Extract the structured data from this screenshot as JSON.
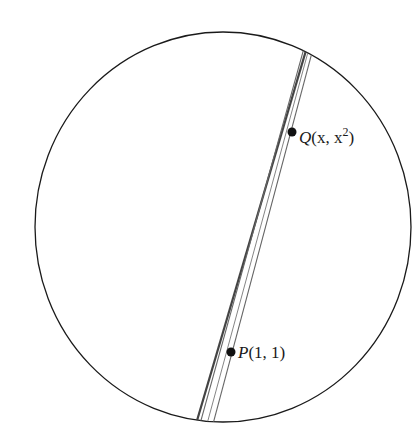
{
  "diagram": {
    "point_p": {
      "label": "P",
      "coords": "(1, 1)"
    },
    "point_q": {
      "label": "Q",
      "coords_prefix": "(x, x",
      "exponent": "2",
      "coords_suffix": ")"
    },
    "colors": {
      "stroke": "#1a1a1a",
      "lines": "#555555",
      "background": "#ffffff"
    }
  }
}
